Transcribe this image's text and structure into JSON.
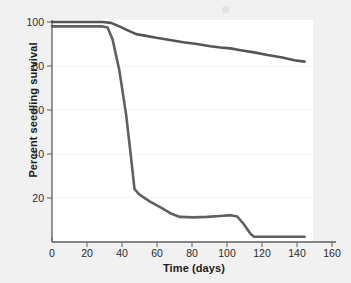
{
  "chart_data": {
    "type": "line",
    "title": "",
    "xlabel": "Time (days)",
    "ylabel": "Percent seedling survival",
    "xlim": [
      0,
      165
    ],
    "ylim": [
      0,
      103
    ],
    "xticks": [
      0,
      20,
      40,
      60,
      80,
      100,
      120,
      140,
      160
    ],
    "xtick_labels": [
      "0",
      "20",
      "40",
      "60",
      "80",
      "100",
      "120",
      "140",
      "160"
    ],
    "yticks": [
      20,
      40,
      60,
      80,
      100
    ],
    "ytick_labels": [
      "20",
      "40",
      "60",
      "80",
      "100"
    ],
    "grid": false,
    "legend": "none",
    "series": [
      {
        "name": "high-survival-curve",
        "color": "#555555",
        "x": [
          0,
          10,
          20,
          30,
          35,
          40,
          45,
          50,
          55,
          62,
          70,
          78,
          86,
          94,
          100,
          106,
          112,
          120,
          128,
          136,
          144,
          150
        ],
        "y": [
          100,
          100,
          100,
          100,
          99.6,
          98,
          96.2,
          94.5,
          93.8,
          92.8,
          91.8,
          90.8,
          90.0,
          89.0,
          88.4,
          88.0,
          87.2,
          86.2,
          85.0,
          84.0,
          82.6,
          82.0
        ]
      },
      {
        "name": "low-survival-curve",
        "color": "#606060",
        "x": [
          0,
          10,
          20,
          30,
          33,
          36,
          40,
          44,
          47,
          49,
          52,
          58,
          65,
          71,
          76,
          84,
          92,
          100,
          106,
          110,
          114,
          118,
          120,
          130,
          140,
          150
        ],
        "y": [
          98,
          98,
          98,
          98,
          97.5,
          92,
          78,
          58,
          38,
          24,
          21.5,
          18.5,
          15.5,
          12.8,
          11.4,
          11.2,
          11.4,
          11.8,
          12.2,
          11.6,
          8.0,
          3.6,
          2.4,
          2.4,
          2.4,
          2.4
        ]
      }
    ]
  },
  "axes": {
    "y_title": "Percent seedling survival",
    "x_title": "Time (days)"
  }
}
